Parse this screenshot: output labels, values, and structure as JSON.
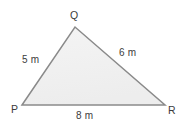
{
  "figure": {
    "type": "triangle-diagram",
    "background_color": "#ffffff",
    "shape": {
      "name": "triangle-PQR",
      "fill_color": "#f0f0f0",
      "stroke_color": "#8a8a8a",
      "stroke_width": 1.5,
      "vertices": [
        {
          "name": "P",
          "x": 22,
          "y": 105
        },
        {
          "name": "Q",
          "x": 75,
          "y": 27
        },
        {
          "name": "R",
          "x": 165,
          "y": 105
        }
      ]
    },
    "vertex_labels": {
      "q": "Q",
      "p": "P",
      "r": "R"
    },
    "side_labels": {
      "pq": "5 m",
      "qr": "6 m",
      "pr": "8 m"
    },
    "text_color": "#3c3c3c"
  }
}
